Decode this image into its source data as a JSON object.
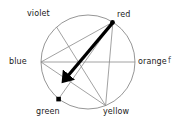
{
  "figure": {
    "background_color": "#ffffff",
    "circle_stroke": "#8a8a8a",
    "chord_stroke": "#8a8a8a",
    "arrow_color": "#000000",
    "marker_color": "#000000",
    "label_color": "#1a1a1a"
  },
  "geometry": {
    "center_x": 88,
    "center_y": 62,
    "radius": 47
  },
  "vertices": [
    {
      "id": "violet",
      "label": "violet",
      "angle_deg": 132,
      "x": 56.6,
      "y": 27.1,
      "label_x": 27,
      "label_y": 9,
      "marker": "none"
    },
    {
      "id": "red",
      "label": "red",
      "angle_deg": 58,
      "x": 112.9,
      "y": 22.1,
      "label_x": 117,
      "label_y": 10,
      "marker": "dot"
    },
    {
      "id": "blue",
      "label": "blue",
      "angle_deg": 180,
      "x": 41,
      "y": 62,
      "label_x": 10,
      "label_y": 57,
      "marker": "none"
    },
    {
      "id": "orange",
      "label": "orange",
      "angle_deg": 0,
      "x": 135,
      "y": 62,
      "label_x": 138,
      "label_y": 57,
      "marker": "none"
    },
    {
      "id": "green",
      "label": "green",
      "angle_deg": 248,
      "x": 70.4,
      "y": 105.6,
      "label_x": 36,
      "label_y": 108,
      "marker": "none"
    },
    {
      "id": "yellow",
      "label": "yellow",
      "angle_deg": 292,
      "x": 105.6,
      "y": 105.6,
      "label_x": 104,
      "label_y": 108,
      "marker": "none"
    }
  ],
  "chords": [
    {
      "id": "blue-orange",
      "from": "blue",
      "to": "orange"
    },
    {
      "id": "blue-red",
      "from": "blue",
      "to": "red"
    },
    {
      "id": "blue-yellow",
      "from": "blue",
      "to": "yellow"
    },
    {
      "id": "violet-yellow",
      "from": "violet",
      "to": "yellow"
    },
    {
      "id": "red-yellow",
      "from": "red",
      "to": "yellow"
    },
    {
      "id": "red-green-marker",
      "from": "red",
      "to": "green-marker"
    }
  ],
  "markers": [
    {
      "id": "red-point",
      "shape": "dot",
      "x": 112.5,
      "y": 22.5,
      "size": 4,
      "description": "filled round point at red vertex"
    },
    {
      "id": "green-point",
      "shape": "square",
      "x": 58.5,
      "y": 99,
      "size": 4.5,
      "description": "filled square point above green label"
    }
  ],
  "arrow": {
    "id": "complement-arrow",
    "from_x": 112.5,
    "from_y": 23.5,
    "to_x": 62.5,
    "to_y": 82.5,
    "stroke_width": 3.2,
    "head_length": 11,
    "head_width": 9,
    "description": "bold arrow from red point toward lower-left interior"
  },
  "edge_artifact": {
    "text": "f",
    "x": 168,
    "y": 57,
    "description": "partial cropped glyph at right edge of crop"
  }
}
